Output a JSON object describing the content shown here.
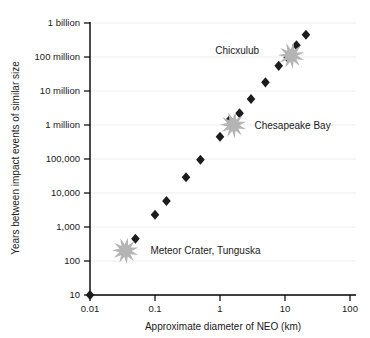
{
  "chart_data": {
    "type": "scatter",
    "title": "",
    "xlabel": "Approximate diameter of NEO (km)",
    "ylabel": "Years between impact events of similar size",
    "xscale": "log",
    "yscale": "log",
    "xlim": [
      0.01,
      100
    ],
    "ylim": [
      10,
      1000000000
    ],
    "grid": true,
    "legend": "none",
    "xticks": [
      0.01,
      0.1,
      1,
      10,
      100
    ],
    "xticklabels": [
      "0.01",
      "0.1",
      "1",
      "10",
      "100"
    ],
    "yticks": [
      10,
      100,
      1000,
      10000,
      100000,
      1000000,
      10000000,
      100000000,
      1000000000
    ],
    "yticklabels": [
      "10",
      "100",
      "1,000",
      "10,000",
      "100,000",
      "1 million",
      "10 million",
      "100 million",
      "1 billion"
    ],
    "series": [
      {
        "name": "impact events",
        "marker": "diamond",
        "color": "#1c1c1c",
        "points": [
          {
            "x": 0.01,
            "y": 10
          },
          {
            "x": 0.05,
            "y": 450
          },
          {
            "x": 0.1,
            "y": 2300
          },
          {
            "x": 0.15,
            "y": 5800
          },
          {
            "x": 0.3,
            "y": 29000
          },
          {
            "x": 0.5,
            "y": 95000
          },
          {
            "x": 1.0,
            "y": 450000
          },
          {
            "x": 1.4,
            "y": 1400000
          },
          {
            "x": 2.0,
            "y": 2200000
          },
          {
            "x": 3.0,
            "y": 5800000
          },
          {
            "x": 5.0,
            "y": 18000000
          },
          {
            "x": 8.0,
            "y": 55000000
          },
          {
            "x": 11.0,
            "y": 95000000
          },
          {
            "x": 15.0,
            "y": 220000000
          },
          {
            "x": 21.0,
            "y": 450000000
          }
        ]
      }
    ],
    "annotations": [
      {
        "label": "Meteor Crater, Tunguska",
        "marker": "starburst",
        "marker_color": "#b4b4b4",
        "x": 0.035,
        "y": 200,
        "label_x": 0.085,
        "label_y": 200,
        "label_anchor": "start"
      },
      {
        "label": "Chesapeake Bay",
        "marker": "starburst",
        "marker_color": "#b4b4b4",
        "x": 1.6,
        "y": 1000000,
        "label_x": 3.4,
        "label_y": 1000000,
        "label_anchor": "start"
      },
      {
        "label": "Chicxulub",
        "marker": "starburst",
        "marker_color": "#b4b4b4",
        "x": 12.5,
        "y": 110000000,
        "label_x": 4.0,
        "label_y": 160000000,
        "label_anchor": "end"
      }
    ]
  }
}
